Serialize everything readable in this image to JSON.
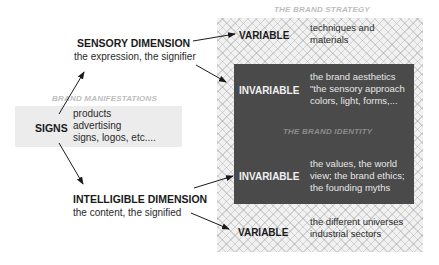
{
  "brand_strategy": {
    "title": "THE BRAND STRATEGY",
    "top_variable": {
      "label": "VARIABLE",
      "lines": [
        "techniques and",
        "materials"
      ]
    },
    "identity": {
      "title": "THE BRAND IDENTITY",
      "top_invariable": {
        "label": "INVARIABLE",
        "lines": [
          "the brand aesthetics",
          "\"the sensory approach",
          "colors, light, forms,..."
        ]
      },
      "bottom_invariable": {
        "label": "INVARIABLE",
        "lines": [
          "the values, the world",
          "view; the brand ethics;",
          "the founding myths"
        ]
      }
    },
    "bottom_variable": {
      "label": "VARIABLE",
      "lines": [
        "the different universes",
        "industrial sectors"
      ]
    }
  },
  "sensory": {
    "heading": "SENSORY DIMENSION",
    "sub": "the expression, the signifier"
  },
  "intelligible": {
    "heading": "INTELLIGIBLE DIMENSION",
    "sub": "the content, the signified"
  },
  "manifestations": {
    "title": "BRAND MANIFESTATIONS",
    "label": "SIGNS",
    "lines": [
      "products",
      "advertising",
      "signs, logos, etc...."
    ]
  },
  "colors": {
    "identity_box": "#4a4a4a",
    "hatch_bg": "#f1f1f1",
    "signs_box": "#ececec",
    "caption": "#bdbdbd"
  }
}
